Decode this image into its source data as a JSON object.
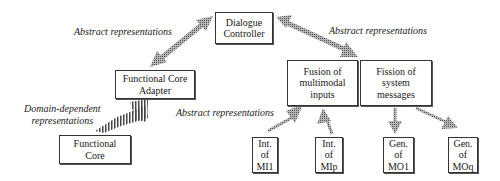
{
  "diagram": {
    "boxes": {
      "dialogue_controller": "Dialogue\nController",
      "functional_core_adapter": "Functional Core\nAdapter",
      "fusion": "Fusion of\nmultimodal\ninputs",
      "fission": "Fission of\nsystem\nmessages",
      "functional_core": "Functional\nCore",
      "int_mi1": "Int.\nof\nMI1",
      "int_mip": "Int.\nof\nMIp",
      "gen_mo1": "Gen.\nof\nMO1",
      "gen_moq": "Gen.\nof\nMOq"
    },
    "labels": {
      "abstract_left": "Abstract representations",
      "abstract_right": "Abstract representations",
      "abstract_bottom": "Abstract representations",
      "domain_dependent": "Domain-dependent\nrepresentations"
    },
    "colors": {
      "arrow_fill": "#8a8a8a",
      "box_border": "#333333"
    }
  }
}
